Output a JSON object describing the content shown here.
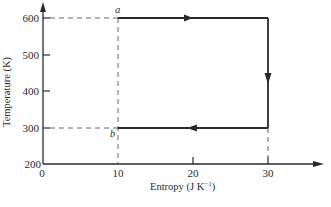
{
  "diagram": {
    "type": "T-S cycle (Carnot)",
    "xlabel": "Entropy (J K",
    "xlabel_sup": "−1",
    "xlabel_end": ")",
    "ylabel": "Temperature (K)",
    "x_ticks": [
      "0",
      "10",
      "20",
      "30"
    ],
    "y_ticks": [
      "600",
      "500",
      "400",
      "300",
      "200"
    ],
    "points": {
      "a": {
        "label": "a",
        "S": 10,
        "T": 600
      },
      "b": {
        "label": "b",
        "S": 10,
        "T": 300
      }
    },
    "cycle": [
      {
        "from": [
          10,
          600
        ],
        "to": [
          30,
          600
        ],
        "direction": "right"
      },
      {
        "from": [
          30,
          600
        ],
        "to": [
          30,
          300
        ],
        "direction": "down"
      },
      {
        "from": [
          30,
          300
        ],
        "to": [
          10,
          300
        ],
        "direction": "left"
      }
    ],
    "colors": {
      "line": "#2a2a2a",
      "dashed": "#555555"
    }
  }
}
